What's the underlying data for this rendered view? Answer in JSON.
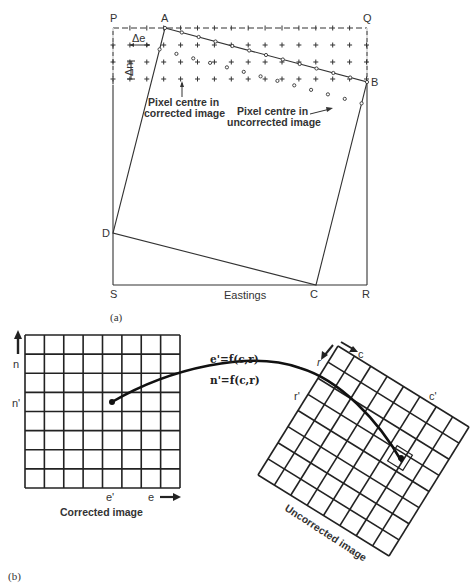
{
  "figure_a": {
    "caption": "(a)",
    "corners": {
      "P": "P",
      "Q": "Q",
      "R": "R",
      "S": "S"
    },
    "vertices": {
      "A": "A",
      "B": "B",
      "C": "C",
      "D": "D"
    },
    "delta_e": "Δe",
    "delta_n": "Δn",
    "axis_label": "Eastings",
    "annotation_corrected": [
      "Pixel centre in",
      "corrected image"
    ],
    "annotation_uncorrected": [
      "Pixel centre in",
      "uncorrected image"
    ]
  },
  "figure_b": {
    "caption": "(b)",
    "corrected": {
      "title": "Corrected image",
      "axis_n": "n",
      "axis_n_prime": "n'",
      "axis_e": "e",
      "axis_e_prime": "e'",
      "rows": 8,
      "cols": 8
    },
    "uncorrected": {
      "title": "Uncorrected image",
      "axis_c": "c",
      "axis_r": "r",
      "axis_c_prime": "c'",
      "axis_r_prime": "r'",
      "rows": 8,
      "cols": 8
    },
    "equations": [
      "e'=f(c,r)",
      "n'=f(c,r)"
    ]
  }
}
